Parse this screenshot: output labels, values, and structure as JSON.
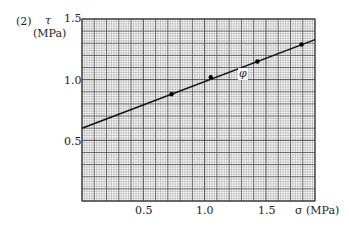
{
  "figure": {
    "panel_label": "(2)",
    "y_symbol": "τ",
    "y_unit": "(MPa)",
    "x_label": "σ (MPa)",
    "angle_label": "φ"
  },
  "chart_data": {
    "type": "scatter",
    "title": "",
    "xlabel": "σ (MPa)",
    "ylabel": "τ (MPa)",
    "xlim": [
      0,
      1.9
    ],
    "ylim": [
      0,
      1.5
    ],
    "x_ticks": [
      "0.5",
      "1.0",
      "1.5"
    ],
    "y_ticks": [
      "0.5",
      "1.0",
      "1.5"
    ],
    "grid": true,
    "grid_minor_step": 0.02,
    "grid_major_step": 0.1,
    "series": [
      {
        "name": "measured",
        "type": "scatter",
        "x": [
          0.73,
          1.05,
          1.43,
          1.79
        ],
        "y": [
          0.88,
          1.02,
          1.15,
          1.29
        ]
      },
      {
        "name": "fit line",
        "type": "line",
        "x": [
          0.0,
          1.9
        ],
        "y": [
          0.6,
          1.33
        ]
      }
    ],
    "annotations": [
      {
        "text": "φ",
        "x": 1.32,
        "y": 1.05,
        "note": "friction angle of fitted line"
      }
    ]
  }
}
